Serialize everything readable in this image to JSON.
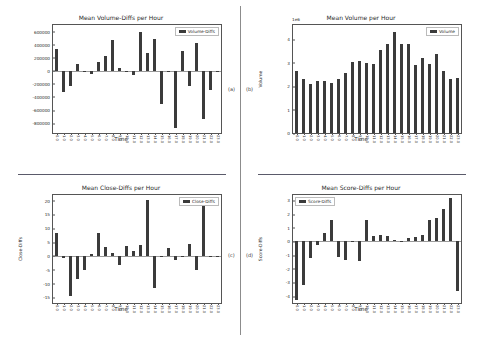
{
  "panels": [
    {
      "label": "(a)",
      "key": "volume_diffs"
    },
    {
      "label": "(b)",
      "key": "volume"
    },
    {
      "label": "(c)",
      "key": "close_diffs"
    },
    {
      "label": "(d)",
      "key": "score_diffs"
    }
  ],
  "chart_data": [
    {
      "type": "bar",
      "panel": "(a)",
      "title": "Mean Volume-Diffs per Hour",
      "xlabel": "Time",
      "ylabel": "",
      "legend": "Volume-Diffs",
      "legend_position": "top-right",
      "grid": false,
      "offset_label": "",
      "ylim": [
        -950000,
        700000
      ],
      "yticks": [
        600000,
        400000,
        200000,
        0,
        -200000,
        -400000,
        -600000,
        -800000
      ],
      "ytick_labels": [
        "600000",
        "400000",
        "200000",
        "0",
        "-200000",
        "-400000",
        "-600000",
        "-800000"
      ],
      "categories": [
        "0.0",
        "1.0",
        "2.0",
        "3.0",
        "4.0",
        "5.0",
        "6.0",
        "7.0",
        "8.0",
        "9.0",
        "10.0",
        "11.0",
        "12.0",
        "13.0",
        "14.0",
        "15.0",
        "16.0",
        "17.0",
        "18.0",
        "19.0",
        "20.0",
        "21.0",
        "22.0",
        "23.0"
      ],
      "values": [
        330000,
        -320000,
        -230000,
        110000,
        0,
        -55000,
        140000,
        220000,
        470000,
        45000,
        -25000,
        -60000,
        600000,
        270000,
        490000,
        -510000,
        -5000,
        -870000,
        300000,
        -230000,
        430000,
        -740000,
        -300000,
        -8000
      ]
    },
    {
      "type": "bar",
      "panel": "(b)",
      "title": "Mean Volume per Hour",
      "xlabel": "Time",
      "ylabel": "Volume",
      "legend": "Volume",
      "legend_position": "top-right",
      "grid": false,
      "offset_label": "1e6",
      "ylim": [
        0,
        4.6
      ],
      "yticks": [
        4,
        3,
        2,
        1,
        0
      ],
      "ytick_labels": [
        "4",
        "3",
        "2",
        "1",
        "0"
      ],
      "categories": [
        "0.0",
        "1.0",
        "2.0",
        "3.0",
        "4.0",
        "5.0",
        "6.0",
        "7.0",
        "8.0",
        "9.0",
        "10.0",
        "11.0",
        "12.0",
        "13.0",
        "14.0",
        "15.0",
        "16.0",
        "17.0",
        "18.0",
        "19.0",
        "20.0",
        "21.0",
        "22.0",
        "23.0"
      ],
      "values": [
        2.65,
        2.3,
        2.1,
        2.2,
        2.22,
        2.15,
        2.3,
        2.55,
        3.02,
        3.05,
        3.0,
        2.95,
        3.55,
        3.8,
        4.3,
        3.78,
        3.78,
        2.9,
        3.18,
        2.92,
        3.35,
        2.65,
        2.32,
        2.33
      ]
    },
    {
      "type": "bar",
      "panel": "(c)",
      "title": "Mean Close-Diffs per Hour",
      "xlabel": "Time",
      "ylabel": "Close-Diffs",
      "legend": "Close-Diffs",
      "legend_position": "top-right",
      "grid": false,
      "offset_label": "",
      "ylim": [
        -17,
        22
      ],
      "yticks": [
        20,
        15,
        10,
        5,
        0,
        -5,
        -10,
        -15
      ],
      "ytick_labels": [
        "20",
        "15",
        "10",
        "5",
        "0",
        "-5",
        "-10",
        "-15"
      ],
      "categories": [
        "0.0",
        "1.0",
        "2.0",
        "3.0",
        "4.0",
        "5.0",
        "6.0",
        "7.0",
        "8.0",
        "9.0",
        "10.0",
        "11.0",
        "12.0",
        "13.0",
        "14.0",
        "15.0",
        "16.0",
        "17.0",
        "18.0",
        "19.0",
        "20.0",
        "21.0",
        "22.0",
        "23.0"
      ],
      "values": [
        8.2,
        -0.6,
        -14.5,
        -8.5,
        -5.0,
        0.8,
        8.4,
        3.2,
        1.0,
        -3.2,
        3.6,
        1.8,
        4.0,
        20.2,
        -11.5,
        -0.4,
        2.9,
        -1.3,
        -0.3,
        4.3,
        -5.2,
        18.0,
        -0.2,
        -0.2
      ]
    },
    {
      "type": "bar",
      "panel": "(d)",
      "title": "Mean Score-Diffs per Hour",
      "xlabel": "Time",
      "ylabel": "Score-Diffs",
      "legend": "Score-Diffs",
      "legend_position": "top-left",
      "grid": false,
      "offset_label": "",
      "ylim": [
        -4.5,
        3.4
      ],
      "yticks": [
        3,
        2,
        1,
        0,
        -1,
        -2,
        -3,
        -4
      ],
      "ytick_labels": [
        "3",
        "2",
        "1",
        "0",
        "-1",
        "-2",
        "-3",
        "-4"
      ],
      "categories": [
        "0.0",
        "1.0",
        "2.0",
        "3.0",
        "4.0",
        "5.0",
        "6.0",
        "7.0",
        "8.0",
        "9.0",
        "10.0",
        "11.0",
        "12.0",
        "13.0",
        "14.0",
        "15.0",
        "16.0",
        "17.0",
        "18.0",
        "19.0",
        "20.0",
        "21.0",
        "22.0",
        "23.0"
      ],
      "values": [
        -4.3,
        -3.15,
        -1.2,
        -0.25,
        0.65,
        1.6,
        -1.1,
        -1.35,
        0.05,
        -1.4,
        1.55,
        0.42,
        0.45,
        0.4,
        0.12,
        -0.05,
        0.25,
        0.35,
        0.45,
        1.58,
        1.75,
        2.4,
        3.15,
        -3.6
      ]
    }
  ]
}
